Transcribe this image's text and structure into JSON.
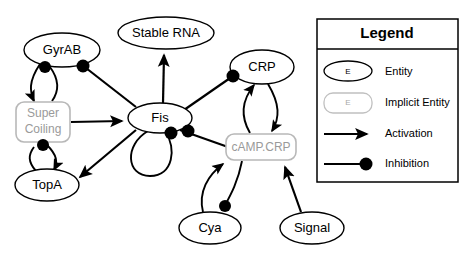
{
  "diagram": {
    "nodes": [
      {
        "id": "gyrab",
        "label": "GyrAB",
        "type": "entity",
        "cx": 62,
        "cy": 50,
        "rx": 38,
        "ry": 17
      },
      {
        "id": "stablerna",
        "label": "Stable RNA",
        "type": "entity",
        "cx": 166,
        "cy": 33,
        "rx": 48,
        "ry": 16
      },
      {
        "id": "crp",
        "label": "CRP",
        "type": "entity",
        "cx": 262,
        "cy": 67,
        "rx": 32,
        "ry": 17
      },
      {
        "id": "supercoil",
        "label": "Super Coiling",
        "label_line1": "Super",
        "label_line2": "Coiling",
        "type": "implicit",
        "cx": 43,
        "cy": 122,
        "w": 54,
        "h": 40
      },
      {
        "id": "fis",
        "label": "Fis",
        "type": "entity",
        "cx": 160,
        "cy": 118,
        "rx": 32,
        "ry": 15
      },
      {
        "id": "camp_crp",
        "label": "cAMP.CRP",
        "type": "implicit",
        "cx": 261,
        "cy": 147,
        "w": 70,
        "h": 26
      },
      {
        "id": "topa",
        "label": "TopA",
        "type": "entity",
        "cx": 47,
        "cy": 185,
        "rx": 32,
        "ry": 16
      },
      {
        "id": "cya",
        "label": "Cya",
        "type": "entity",
        "cx": 210,
        "cy": 228,
        "rx": 31,
        "ry": 16
      },
      {
        "id": "signal",
        "label": "Signal",
        "type": "entity",
        "cx": 312,
        "cy": 228,
        "rx": 32,
        "ry": 16
      }
    ],
    "edges": [
      {
        "from": "gyrab",
        "to": "supercoil",
        "kind": "activation"
      },
      {
        "from": "supercoil",
        "to": "gyrab",
        "kind": "inhibition"
      },
      {
        "from": "supercoil",
        "to": "topa",
        "kind": "activation"
      },
      {
        "from": "topa",
        "to": "supercoil",
        "kind": "inhibition"
      },
      {
        "from": "supercoil",
        "to": "fis",
        "kind": "activation"
      },
      {
        "from": "fis",
        "to": "gyrab",
        "kind": "inhibition"
      },
      {
        "from": "fis",
        "to": "stablerna",
        "kind": "activation"
      },
      {
        "from": "fis",
        "to": "topa",
        "kind": "activation"
      },
      {
        "from": "fis",
        "to": "crp",
        "kind": "inhibition"
      },
      {
        "from": "fis",
        "to": "camp_crp",
        "kind": "inhibition"
      },
      {
        "from": "fis",
        "to": "fis",
        "kind": "inhibition"
      },
      {
        "from": "crp",
        "to": "camp_crp",
        "kind": "activation"
      },
      {
        "from": "camp_crp",
        "to": "crp",
        "kind": "activation"
      },
      {
        "from": "cya",
        "to": "camp_crp",
        "kind": "activation"
      },
      {
        "from": "camp_crp",
        "to": "cya",
        "kind": "inhibition"
      },
      {
        "from": "signal",
        "to": "camp_crp",
        "kind": "activation"
      }
    ]
  },
  "legend": {
    "title": "Legend",
    "glyph_letter": "E",
    "items": [
      {
        "key": "entity",
        "label": "Entity",
        "glyph": "ellipse-outline"
      },
      {
        "key": "implicit",
        "label": "Implicit Entity",
        "glyph": "rounded-rect-gray"
      },
      {
        "key": "activation",
        "label": "Activation",
        "glyph": "arrow-line"
      },
      {
        "key": "inhibition",
        "label": "Inhibition",
        "glyph": "dot-line"
      }
    ]
  },
  "colors": {
    "stroke": "#000000",
    "implicit_stroke": "#b8b8b8",
    "implicit_text": "#9a9a9a",
    "background": "#ffffff"
  }
}
